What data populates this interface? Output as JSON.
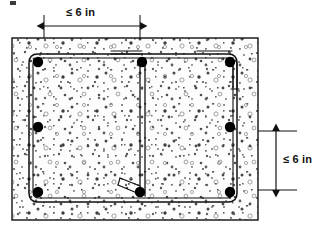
{
  "figure": {
    "type": "engineering-cross-section",
    "background_color": "#ffffff",
    "line_color": "#111111",
    "concrete_fill_color": "#fdfdfd",
    "aggregate_dot_color": "#555555",
    "rebar_dot_color": "#000000"
  },
  "dimensions": {
    "top": {
      "label": "≤ 6 in",
      "orientation": "horizontal",
      "arrowheads": "both",
      "start_x": 44,
      "end_x": 140,
      "line_y": 26
    },
    "right": {
      "label": "≤ 6 in",
      "orientation": "vertical",
      "arrowheads": "both",
      "start_y": 131,
      "end_y": 190,
      "line_x": 276
    }
  },
  "concrete_section": {
    "x": 12,
    "y": 38,
    "width": 246,
    "height": 182,
    "border_color": "#111111"
  },
  "stirrup": {
    "x": 29,
    "y": 54,
    "width": 208,
    "height": 148,
    "corner_radius": 9,
    "stroke_color": "#111111",
    "description": "closed rectangular hoop with rounded corners and hook tail at top right"
  },
  "crosstie": {
    "x": 142,
    "top_y": 54,
    "bottom_y": 196,
    "description": "interior vertical crosstie with horizontal hook at top and 135 degree hook at bottom"
  },
  "rebars": [
    {
      "name": "bar-top-left",
      "cx": 38,
      "cy": 62
    },
    {
      "name": "bar-top-center",
      "cx": 142,
      "cy": 62
    },
    {
      "name": "bar-top-right",
      "cx": 230,
      "cy": 62
    },
    {
      "name": "bar-mid-left",
      "cx": 38,
      "cy": 127
    },
    {
      "name": "bar-mid-right",
      "cx": 230,
      "cy": 127
    },
    {
      "name": "bar-bottom-left",
      "cx": 38,
      "cy": 192
    },
    {
      "name": "bar-bottom-center",
      "cx": 140,
      "cy": 192
    },
    {
      "name": "bar-bottom-right",
      "cx": 230,
      "cy": 192
    }
  ],
  "artifact": {
    "name": "crop-mark-top-left",
    "x": 10,
    "y": 1,
    "width": 6,
    "height": 4
  }
}
